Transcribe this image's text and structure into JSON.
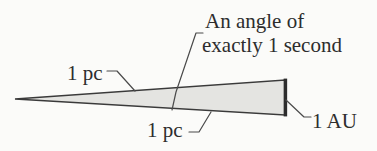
{
  "diagram": {
    "labels": {
      "angle_line1": "An angle of",
      "angle_line2": "exactly 1 second",
      "pc_top": "1 pc",
      "pc_bottom": "1 pc",
      "au": "1 AU"
    },
    "colors": {
      "background": "#fbfbf9",
      "triangle_fill": "#e4e4e1",
      "triangle_stroke": "#3a3a3a",
      "right_edge_stroke": "#2c2c2c",
      "leader_line": "#4a4a4a",
      "text": "#2d2d2d"
    }
  }
}
